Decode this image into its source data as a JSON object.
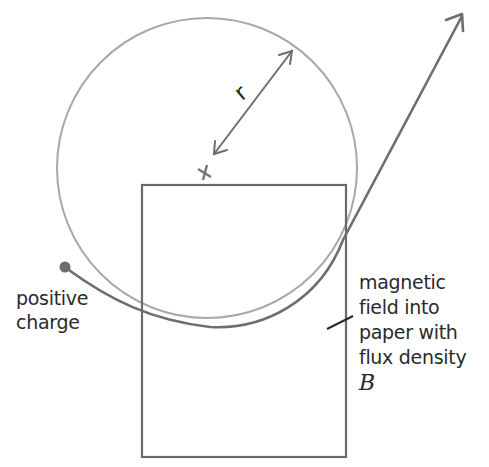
{
  "diagram": {
    "labels": {
      "charge": [
        "positive",
        "charge"
      ],
      "field": [
        "magnetic",
        "field into",
        "paper with",
        "flux density"
      ],
      "field_symbol": "B",
      "radius": "r"
    },
    "colors": {
      "circle": "#a8a8a8",
      "path": "#6e6e6e",
      "box": "#6a6a6a",
      "pointer": "#2a2a2a",
      "text": "#2a2a2a"
    },
    "geometry": {
      "circle_center": [
        207,
        168
      ],
      "circle_radius": 150,
      "field_region": {
        "x": 142,
        "y": 185,
        "width": 204,
        "height": 272
      },
      "charge_start": [
        65,
        267
      ],
      "exit_arrow_tip": [
        462,
        14
      ]
    }
  }
}
